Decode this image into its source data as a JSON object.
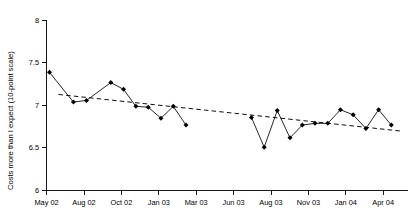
{
  "chart_data": {
    "type": "line",
    "title": "",
    "xlabel": "",
    "ylabel": "Costs more than I expect (10-point scale)",
    "ylim": [
      6,
      8
    ],
    "yticks": [
      6,
      6.5,
      7,
      7.5,
      8
    ],
    "ytick_labels": [
      "6",
      "6.5",
      "7",
      "7.5",
      "8"
    ],
    "xtick_labels": [
      "May 02",
      "Aug 02",
      "Oct 02",
      "Jan 03",
      "Mar 03",
      "Jun 03",
      "Aug 03",
      "Nov 03",
      "Jan 04",
      "Apr 04"
    ],
    "grid": false,
    "legend": "none",
    "series": [
      {
        "name": "Costs more than I expect",
        "marker": "filled-diamond",
        "has_gap": true,
        "points": [
          {
            "x": 0.08,
            "y": 7.39
          },
          {
            "x": 0.72,
            "y": 7.04
          },
          {
            "x": 1.07,
            "y": 7.06
          },
          {
            "x": 1.72,
            "y": 7.27
          },
          {
            "x": 2.06,
            "y": 7.19
          },
          {
            "x": 2.39,
            "y": 6.99
          },
          {
            "x": 2.72,
            "y": 6.98
          },
          {
            "x": 3.06,
            "y": 6.85
          },
          {
            "x": 3.39,
            "y": 6.99
          },
          {
            "x": 3.73,
            "y": 6.77
          },
          {
            "x": 5.48,
            "y": 6.86
          },
          {
            "x": 5.82,
            "y": 6.51
          },
          {
            "x": 6.17,
            "y": 6.94
          },
          {
            "x": 6.51,
            "y": 6.62
          },
          {
            "x": 6.84,
            "y": 6.77
          },
          {
            "x": 7.18,
            "y": 6.79
          },
          {
            "x": 7.52,
            "y": 6.79
          },
          {
            "x": 7.86,
            "y": 6.95
          },
          {
            "x": 8.2,
            "y": 6.89
          },
          {
            "x": 8.54,
            "y": 6.73
          },
          {
            "x": 8.88,
            "y": 6.95
          },
          {
            "x": 9.22,
            "y": 6.77
          }
        ]
      }
    ],
    "trendline": {
      "type": "linear-dashed",
      "start": {
        "x": 0.32,
        "y": 7.13
      },
      "end": {
        "x": 9.46,
        "y": 6.7
      }
    }
  }
}
